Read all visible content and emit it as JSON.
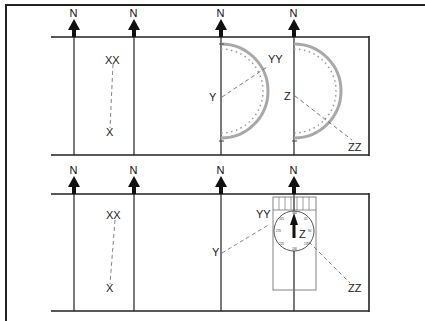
{
  "diagram": {
    "north_label": "N",
    "top_panel": {
      "points": {
        "start_x": "X",
        "end_x": "XX",
        "start_y": "Y",
        "end_y": "YY",
        "start_z": "Z",
        "end_z": "ZZ"
      },
      "tool": "protractor"
    },
    "bottom_panel": {
      "points": {
        "start_x": "X",
        "end_x": "XX",
        "start_y": "Y",
        "end_y": "YY",
        "start_z": "Z",
        "end_z": "ZZ"
      },
      "tool": "baseplate compass",
      "compass_dial": {
        "n": "360",
        "e": "90",
        "s": "180",
        "w": "270",
        "ne": "45",
        "se": "135",
        "sw": "225",
        "nw": "315"
      }
    },
    "colors": {
      "line": "#1a1a1a",
      "protractor": "#a8a8a8",
      "dashed": "#555555",
      "background": "#ffffff"
    }
  }
}
